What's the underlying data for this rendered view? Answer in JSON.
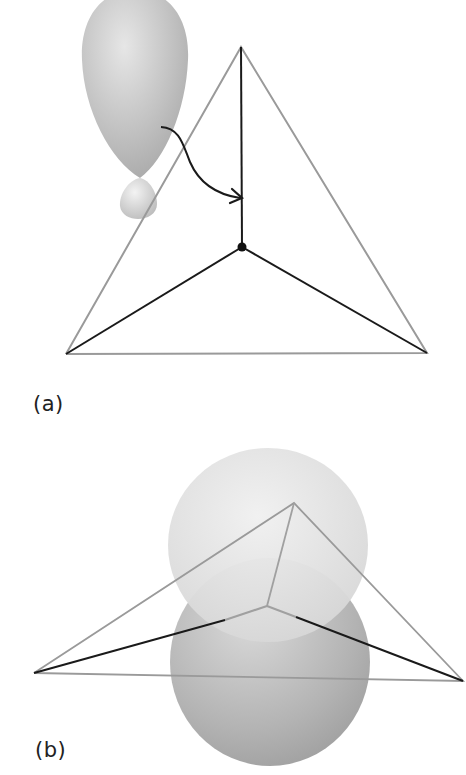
{
  "panels": [
    {
      "label": "(a)",
      "description": "Tetrahedral fragment with sp3 hybrid orbital (large lobe and small lobe) and curved arrow pointing to the vertical bond above the central atom",
      "elements": {
        "hybrid_orbital": {
          "large_lobe": true,
          "small_lobe": true
        },
        "arrow": {
          "from": "orbital lobe",
          "to": "vertical bond"
        },
        "central_atom_dot": true
      }
    },
    {
      "label": "(b)",
      "description": "Flattened tetrahedral/trigonal fragment with p orbital (upper and lower spherical lobes) centered on the central atom",
      "elements": {
        "p_orbital": {
          "upper_lobe": true,
          "lower_lobe": true
        }
      }
    }
  ],
  "colors": {
    "outline_gray": "#9a9a9a",
    "bond_black": "#1a1a1a",
    "lobe_light": "#d8d8d8",
    "lobe_dark": "#a8a8a8",
    "background": "#ffffff"
  }
}
